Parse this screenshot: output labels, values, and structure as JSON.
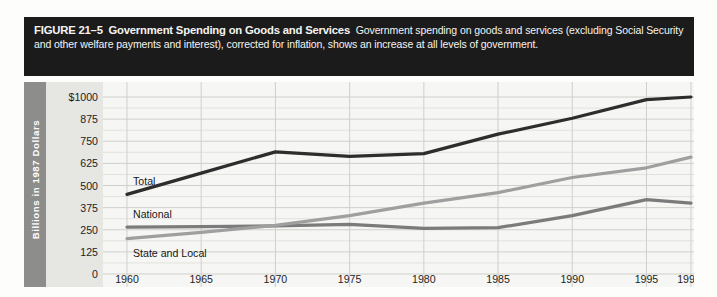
{
  "figure": {
    "number_label": "FIGURE 21–5",
    "title": "Government Spending on Goods and Services",
    "caption": "Government spending on goods and services (excluding Social Security and other welfare payments and interest), corrected for inflation, shows an increase at all levels of government."
  },
  "colors": {
    "caption_background": "#1b1b1b",
    "caption_text": "#f4f4f2",
    "axis_band": "#8d8d8b",
    "plot_background": "#f6f6f4",
    "gridline": "#cfcfcb",
    "total_line": "#2d2d2d",
    "national_line": "#7b7b7b",
    "state_local_line": "#9f9f9f"
  },
  "chart_data": {
    "type": "line",
    "title": "Government Spending on Goods and Services",
    "xlabel": "",
    "ylabel": "Billions in 1987 Dollars",
    "x": [
      1960,
      1965,
      1970,
      1975,
      1980,
      1985,
      1990,
      1995,
      1998
    ],
    "xtick_labels": [
      "1960",
      "1965",
      "1970",
      "1975",
      "1980",
      "1985",
      "1990",
      "1995",
      "1998*"
    ],
    "ytick_labels": [
      "$1000",
      "875",
      "750",
      "625",
      "500",
      "375",
      "250",
      "125",
      "0"
    ],
    "ytick_values": [
      1000,
      875,
      750,
      625,
      500,
      375,
      250,
      125,
      0
    ],
    "ylim": [
      0,
      1000
    ],
    "xlim": [
      1960,
      1998
    ],
    "grid": true,
    "legend_position": "inline-labels",
    "series": [
      {
        "name": "Total",
        "color": "#2d2d2d",
        "values": [
          450,
          570,
          690,
          665,
          680,
          790,
          880,
          985,
          1000
        ]
      },
      {
        "name": "National",
        "color": "#7b7b7b",
        "values": [
          265,
          268,
          272,
          280,
          258,
          262,
          330,
          420,
          400
        ]
      },
      {
        "name": "State and Local",
        "color": "#9f9f9f",
        "values": [
          200,
          235,
          275,
          330,
          400,
          460,
          545,
          600,
          660
        ]
      }
    ],
    "footnote_marker": "*"
  }
}
